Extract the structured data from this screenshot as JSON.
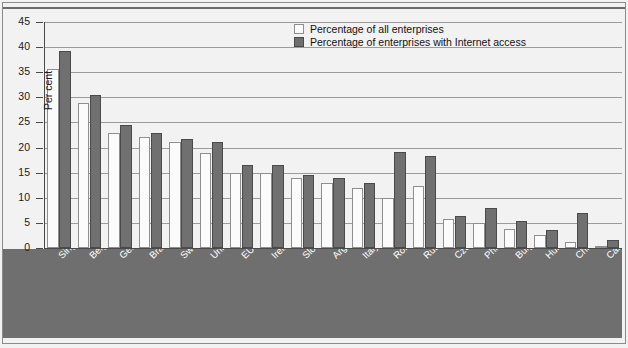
{
  "chart_data": {
    "type": "bar",
    "title": "",
    "xlabel": "",
    "ylabel": "Per cent",
    "ylim": [
      0,
      45
    ],
    "ytick_step": 5,
    "yticks": [
      45,
      40,
      35,
      30,
      25,
      20,
      15,
      10,
      5,
      0
    ],
    "grid": true,
    "legend_position": "top-center",
    "categories": [
      "Singapore",
      "Belgium",
      "Germany",
      "Brazil",
      "Sweden",
      "United Kingdom",
      "EU average",
      "Ireland",
      "Slovenia",
      "Argentina (1) (2)",
      "Italy",
      "Romania (2)",
      "Russian Fed. (2) (3)",
      "Czech Republic",
      "Philippines (4)",
      "Bulgaria (2)",
      "Hungary",
      "Chile (5)",
      "Cameroon"
    ],
    "series": [
      {
        "name": "Percentage of all enterprises",
        "color": "#fbfbfb",
        "values": [
          35.6,
          28.8,
          23.0,
          22.1,
          21.2,
          19.0,
          15.0,
          15.0,
          13.9,
          12.9,
          12.0,
          10.0,
          12.3,
          5.7,
          5.0,
          3.8,
          2.6,
          1.2,
          0.4
        ]
      },
      {
        "name": "Percentage of enterprises with Internet access",
        "color": "#707070",
        "values": [
          39.3,
          30.4,
          24.5,
          23.0,
          21.7,
          21.1,
          16.6,
          16.6,
          14.6,
          13.9,
          13.0,
          19.1,
          18.4,
          6.3,
          8.0,
          5.4,
          3.5,
          7.0,
          1.5
        ]
      }
    ]
  },
  "legend": {
    "items": [
      {
        "label": "Percentage of all enterprises",
        "swatch": "light"
      },
      {
        "label": "Percentage of enterprises with Internet access",
        "swatch": "dark"
      }
    ]
  }
}
